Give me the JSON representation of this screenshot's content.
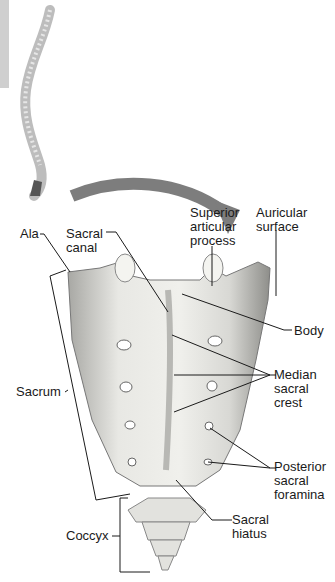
{
  "figure": {
    "labels": {
      "ala": "Ala",
      "sacral_canal": "Sacral\ncanal",
      "superior_articular_process": "Superior\narticular\nprocess",
      "auricular_surface": "Auricular\nsurface",
      "body": "Body",
      "median_sacral_crest": "Median\nsacral\ncrest",
      "sacrum": "Sacrum",
      "posterior_sacral_foramina": "Posterior\nsacral\nforamina",
      "sacral_hiatus": "Sacral\nhiatus",
      "coccyx": "Coccyx"
    },
    "colors": {
      "bone": "#e6e6e2",
      "bone_shadow": "#9a9a96",
      "arrow": "#7d7d7d",
      "leader": "#1a1a1a",
      "side_tab": "#cfcfcf"
    }
  }
}
